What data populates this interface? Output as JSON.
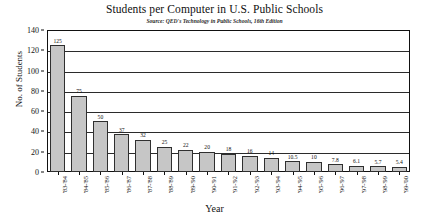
{
  "chart_data": {
    "type": "bar",
    "title": "Students per Computer in U.S. Public Schools",
    "subtitle": "Source: QED's Technology in Public Schools, 16th Edition",
    "xlabel": "Year",
    "ylabel": "No. of Students",
    "ylim": [
      0,
      140
    ],
    "yticks": [
      0,
      20,
      40,
      60,
      80,
      100,
      120,
      140
    ],
    "ytick_labels": [
      "0",
      "20",
      "40",
      "60",
      "80",
      "100",
      "120",
      "140"
    ],
    "grid": true,
    "legend": false,
    "legend_position": "none",
    "bar_color": "#c6c6c6",
    "bar_border_color": "#2f2f2f",
    "categories": [
      "'83-'84",
      "'84-'85",
      "'85-'86",
      "'86-'87",
      "'87-'88",
      "'88-'89",
      "'89-'90",
      "'90-'91",
      "'91-'92",
      "'92-'93",
      "'93-'94",
      "'94-'95",
      "'95-'96",
      "'96-'97",
      "'97-'98",
      "'98-'99",
      "'99-'00"
    ],
    "values": [
      125,
      75,
      50,
      37,
      32,
      25,
      22,
      20,
      18,
      16,
      14,
      10.5,
      10,
      7.8,
      6.1,
      5.7,
      5.4
    ],
    "value_labels": [
      "125",
      "75",
      "50",
      "37",
      "32",
      "25",
      "22",
      "20",
      "18",
      "16",
      "14",
      "10.5",
      "10",
      "7.8",
      "6.1",
      "5.7",
      "5.4"
    ]
  }
}
